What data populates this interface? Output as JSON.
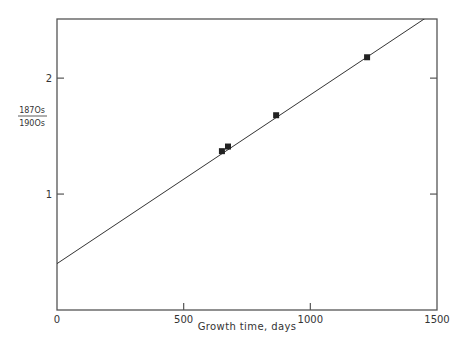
{
  "chart_data": {
    "type": "scatter",
    "title": "",
    "xlabel": "Growth time, days",
    "ylabel": "187Os / 190Os",
    "ylabel_numerator": "187Os",
    "ylabel_denominator": "190Os",
    "xlim": [
      0,
      1500
    ],
    "ylim": [
      0,
      2.51
    ],
    "x_ticks": [
      0,
      500,
      1000,
      1500
    ],
    "x_tick_labels": [
      "0",
      "500",
      "1000",
      "1500"
    ],
    "y_ticks": [
      1,
      2
    ],
    "y_tick_labels": [
      "1",
      "2"
    ],
    "grid": false,
    "legend": null,
    "series": [
      {
        "name": "measurements",
        "marker": "square",
        "x": [
          651,
          675,
          865,
          1224
        ],
        "y": [
          1.37,
          1.41,
          1.68,
          2.18
        ]
      }
    ],
    "fit_line": {
      "intercept": 0.4,
      "slope": 0.001456,
      "x_start": 0,
      "x_end": 1500
    },
    "colors": {
      "axes": "#555555",
      "line": "#333333",
      "marker": "#222222"
    }
  }
}
